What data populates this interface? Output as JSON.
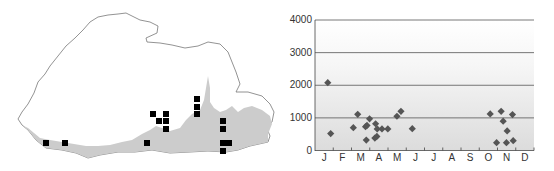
{
  "map": {
    "title": "Distribution map",
    "outline_color": "#777777",
    "lowland_color": "#cccccc",
    "marker_color": "#000000",
    "markers": [
      {
        "x": 46,
        "y": 143
      },
      {
        "x": 65,
        "y": 143
      },
      {
        "x": 147,
        "y": 143
      },
      {
        "x": 153,
        "y": 114
      },
      {
        "x": 166,
        "y": 114
      },
      {
        "x": 159,
        "y": 121
      },
      {
        "x": 166,
        "y": 121
      },
      {
        "x": 166,
        "y": 129
      },
      {
        "x": 197,
        "y": 99
      },
      {
        "x": 197,
        "y": 107
      },
      {
        "x": 197,
        "y": 114
      },
      {
        "x": 223,
        "y": 121
      },
      {
        "x": 223,
        "y": 129
      },
      {
        "x": 223,
        "y": 143
      },
      {
        "x": 229,
        "y": 143
      },
      {
        "x": 223,
        "y": 151
      }
    ]
  },
  "chart_data": {
    "type": "scatter",
    "title": "",
    "xlabel": "",
    "ylabel": "",
    "x_tick_labels": [
      "J",
      "F",
      "M",
      "A",
      "M",
      "J",
      "J",
      "A",
      "S",
      "O",
      "N",
      "D"
    ],
    "y_tick_labels": [
      "0",
      "1000",
      "2000",
      "3000",
      "4000"
    ],
    "ylim": [
      0,
      4000
    ],
    "xlim": [
      0,
      12
    ],
    "grid": "horizontal at 1000, 2000, 3000, 4000",
    "marker": "diamond",
    "marker_color": "#555555",
    "background": "gradient white (top) to light grey (bottom)",
    "points": [
      {
        "month": 0.7,
        "elevation": 2080
      },
      {
        "month": 0.86,
        "elevation": 520
      },
      {
        "month": 2.1,
        "elevation": 700
      },
      {
        "month": 2.34,
        "elevation": 1110
      },
      {
        "month": 2.77,
        "elevation": 730
      },
      {
        "month": 2.85,
        "elevation": 770
      },
      {
        "month": 2.99,
        "elevation": 970
      },
      {
        "month": 2.81,
        "elevation": 320
      },
      {
        "month": 3.32,
        "elevation": 820
      },
      {
        "month": 3.41,
        "elevation": 660
      },
      {
        "month": 3.67,
        "elevation": 660
      },
      {
        "month": 3.99,
        "elevation": 660
      },
      {
        "month": 3.28,
        "elevation": 380
      },
      {
        "month": 3.39,
        "elevation": 430
      },
      {
        "month": 4.49,
        "elevation": 1050
      },
      {
        "month": 4.71,
        "elevation": 1200
      },
      {
        "month": 5.33,
        "elevation": 670
      },
      {
        "month": 9.6,
        "elevation": 1120
      },
      {
        "month": 9.95,
        "elevation": 240
      },
      {
        "month": 10.2,
        "elevation": 1200
      },
      {
        "month": 10.31,
        "elevation": 900
      },
      {
        "month": 10.53,
        "elevation": 600
      },
      {
        "month": 10.49,
        "elevation": 240
      },
      {
        "month": 10.82,
        "elevation": 1100
      },
      {
        "month": 10.86,
        "elevation": 300
      }
    ]
  }
}
